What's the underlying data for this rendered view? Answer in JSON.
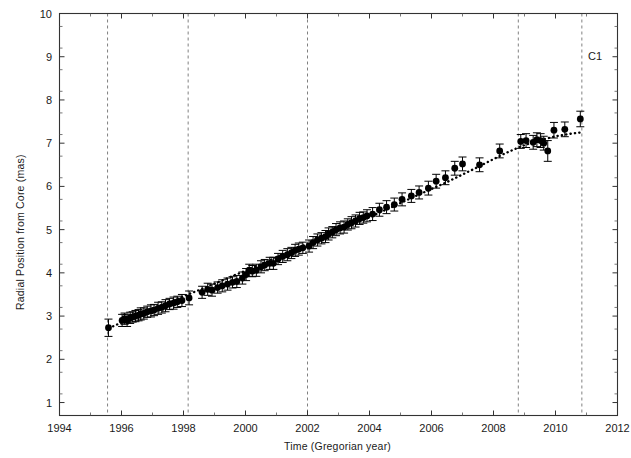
{
  "chart_data": {
    "type": "scatter",
    "title": "",
    "xlabel": "Time (Gregorian year)",
    "ylabel": "Radial Position from Core (mas)",
    "xlim": [
      1994,
      2012
    ],
    "ylim": [
      0.7,
      10
    ],
    "xticks": [
      1994,
      1996,
      1998,
      2000,
      2002,
      2004,
      2006,
      2008,
      2010,
      2012
    ],
    "yticks": [
      1,
      2,
      3,
      4,
      5,
      6,
      7,
      8,
      9,
      10
    ],
    "xtick_labels": [
      "1994",
      "1996",
      "1998",
      "2000",
      "2002",
      "2004",
      "2006",
      "2008",
      "2010",
      "2012"
    ],
    "ytick_labels": [
      "1",
      "2",
      "3",
      "4",
      "5",
      "6",
      "7",
      "8",
      "9",
      "10"
    ],
    "grid": false,
    "legend": null,
    "marker": "filled-circle",
    "marker_color": "#000000",
    "errorbar_color": "#000000",
    "annotations": [
      {
        "name": "C1",
        "text": "C1",
        "x": 2011.05,
        "y": 9.0
      }
    ],
    "vlines": [
      {
        "x": 1995.55,
        "style": "dashed",
        "color": "#808080"
      },
      {
        "x": 1998.15,
        "style": "dashed",
        "color": "#808080"
      },
      {
        "x": 2002.0,
        "style": "dashed",
        "color": "#808080"
      },
      {
        "x": 2008.8,
        "style": "dashed",
        "color": "#808080"
      },
      {
        "x": 2010.85,
        "style": "dashed",
        "color": "#808080"
      }
    ],
    "fit_curve": {
      "name": "fit",
      "style": "dotted",
      "color": "#000000",
      "x": [
        1995.6,
        1996.5,
        1997.5,
        1998.5,
        1999.5,
        2000.5,
        2001.5,
        2002.5,
        2003.5,
        2004.5,
        2005.5,
        2006.5,
        2007.5,
        2008.3,
        2008.9,
        2009.4,
        2010.0,
        2010.5,
        2010.85
      ],
      "y": [
        2.72,
        3.02,
        3.32,
        3.6,
        3.9,
        4.2,
        4.52,
        4.82,
        5.13,
        5.45,
        5.78,
        6.1,
        6.45,
        6.74,
        6.93,
        7.05,
        7.16,
        7.22,
        7.25
      ]
    },
    "series": [
      {
        "name": "C1 radial position",
        "points": [
          {
            "x": 1995.58,
            "y": 2.73,
            "yerr": 0.2
          },
          {
            "x": 1996.02,
            "y": 2.9,
            "yerr": 0.14
          },
          {
            "x": 1996.1,
            "y": 2.94,
            "yerr": 0.13
          },
          {
            "x": 1996.18,
            "y": 2.9,
            "yerr": 0.14
          },
          {
            "x": 1996.28,
            "y": 2.96,
            "yerr": 0.13
          },
          {
            "x": 1996.36,
            "y": 2.98,
            "yerr": 0.12
          },
          {
            "x": 1996.45,
            "y": 3.0,
            "yerr": 0.13
          },
          {
            "x": 1996.55,
            "y": 3.02,
            "yerr": 0.13
          },
          {
            "x": 1996.62,
            "y": 3.05,
            "yerr": 0.14
          },
          {
            "x": 1996.72,
            "y": 3.06,
            "yerr": 0.13
          },
          {
            "x": 1996.83,
            "y": 3.1,
            "yerr": 0.13
          },
          {
            "x": 1996.95,
            "y": 3.12,
            "yerr": 0.14
          },
          {
            "x": 1997.05,
            "y": 3.14,
            "yerr": 0.13
          },
          {
            "x": 1997.18,
            "y": 3.18,
            "yerr": 0.14
          },
          {
            "x": 1997.3,
            "y": 3.2,
            "yerr": 0.13
          },
          {
            "x": 1997.42,
            "y": 3.24,
            "yerr": 0.14
          },
          {
            "x": 1997.55,
            "y": 3.28,
            "yerr": 0.13
          },
          {
            "x": 1997.68,
            "y": 3.3,
            "yerr": 0.14
          },
          {
            "x": 1997.8,
            "y": 3.33,
            "yerr": 0.13
          },
          {
            "x": 1997.95,
            "y": 3.36,
            "yerr": 0.14
          },
          {
            "x": 1998.18,
            "y": 3.42,
            "yerr": 0.16
          },
          {
            "x": 1998.6,
            "y": 3.55,
            "yerr": 0.14
          },
          {
            "x": 1998.78,
            "y": 3.62,
            "yerr": 0.14
          },
          {
            "x": 1998.92,
            "y": 3.6,
            "yerr": 0.14
          },
          {
            "x": 1999.1,
            "y": 3.66,
            "yerr": 0.13
          },
          {
            "x": 1999.25,
            "y": 3.7,
            "yerr": 0.14
          },
          {
            "x": 1999.42,
            "y": 3.74,
            "yerr": 0.14
          },
          {
            "x": 1999.58,
            "y": 3.78,
            "yerr": 0.13
          },
          {
            "x": 1999.72,
            "y": 3.8,
            "yerr": 0.14
          },
          {
            "x": 1999.9,
            "y": 3.88,
            "yerr": 0.14
          },
          {
            "x": 2000.02,
            "y": 3.96,
            "yerr": 0.14
          },
          {
            "x": 2000.12,
            "y": 4.06,
            "yerr": 0.14
          },
          {
            "x": 2000.22,
            "y": 4.04,
            "yerr": 0.13
          },
          {
            "x": 2000.35,
            "y": 4.06,
            "yerr": 0.14
          },
          {
            "x": 2000.5,
            "y": 4.14,
            "yerr": 0.14
          },
          {
            "x": 2000.62,
            "y": 4.18,
            "yerr": 0.13
          },
          {
            "x": 2000.78,
            "y": 4.22,
            "yerr": 0.14
          },
          {
            "x": 2000.9,
            "y": 4.22,
            "yerr": 0.14
          },
          {
            "x": 2001.05,
            "y": 4.32,
            "yerr": 0.13
          },
          {
            "x": 2001.2,
            "y": 4.38,
            "yerr": 0.14
          },
          {
            "x": 2001.35,
            "y": 4.42,
            "yerr": 0.14
          },
          {
            "x": 2001.48,
            "y": 4.46,
            "yerr": 0.13
          },
          {
            "x": 2001.6,
            "y": 4.52,
            "yerr": 0.14
          },
          {
            "x": 2001.72,
            "y": 4.55,
            "yerr": 0.14
          },
          {
            "x": 2001.85,
            "y": 4.58,
            "yerr": 0.13
          },
          {
            "x": 2002.05,
            "y": 4.62,
            "yerr": 0.14
          },
          {
            "x": 2002.18,
            "y": 4.7,
            "yerr": 0.14
          },
          {
            "x": 2002.32,
            "y": 4.76,
            "yerr": 0.14
          },
          {
            "x": 2002.45,
            "y": 4.8,
            "yerr": 0.13
          },
          {
            "x": 2002.58,
            "y": 4.84,
            "yerr": 0.14
          },
          {
            "x": 2002.68,
            "y": 4.9,
            "yerr": 0.14
          },
          {
            "x": 2002.8,
            "y": 4.94,
            "yerr": 0.13
          },
          {
            "x": 2002.92,
            "y": 5.0,
            "yerr": 0.14
          },
          {
            "x": 2003.05,
            "y": 5.04,
            "yerr": 0.14
          },
          {
            "x": 2003.18,
            "y": 5.06,
            "yerr": 0.14
          },
          {
            "x": 2003.3,
            "y": 5.12,
            "yerr": 0.13
          },
          {
            "x": 2003.42,
            "y": 5.16,
            "yerr": 0.14
          },
          {
            "x": 2003.55,
            "y": 5.2,
            "yerr": 0.14
          },
          {
            "x": 2003.68,
            "y": 5.26,
            "yerr": 0.14
          },
          {
            "x": 2003.8,
            "y": 5.28,
            "yerr": 0.13
          },
          {
            "x": 2003.92,
            "y": 5.32,
            "yerr": 0.14
          },
          {
            "x": 2004.1,
            "y": 5.36,
            "yerr": 0.15
          },
          {
            "x": 2004.32,
            "y": 5.46,
            "yerr": 0.15
          },
          {
            "x": 2004.55,
            "y": 5.52,
            "yerr": 0.15
          },
          {
            "x": 2004.8,
            "y": 5.58,
            "yerr": 0.15
          },
          {
            "x": 2005.05,
            "y": 5.7,
            "yerr": 0.15
          },
          {
            "x": 2005.35,
            "y": 5.78,
            "yerr": 0.15
          },
          {
            "x": 2005.6,
            "y": 5.86,
            "yerr": 0.15
          },
          {
            "x": 2005.9,
            "y": 5.96,
            "yerr": 0.16
          },
          {
            "x": 2006.15,
            "y": 6.12,
            "yerr": 0.16
          },
          {
            "x": 2006.45,
            "y": 6.2,
            "yerr": 0.16
          },
          {
            "x": 2006.75,
            "y": 6.42,
            "yerr": 0.16
          },
          {
            "x": 2007.0,
            "y": 6.52,
            "yerr": 0.16
          },
          {
            "x": 2007.55,
            "y": 6.5,
            "yerr": 0.16
          },
          {
            "x": 2008.2,
            "y": 6.82,
            "yerr": 0.16
          },
          {
            "x": 2008.88,
            "y": 7.04,
            "yerr": 0.16
          },
          {
            "x": 2009.05,
            "y": 7.06,
            "yerr": 0.16
          },
          {
            "x": 2009.28,
            "y": 7.02,
            "yerr": 0.16
          },
          {
            "x": 2009.4,
            "y": 7.08,
            "yerr": 0.16
          },
          {
            "x": 2009.52,
            "y": 7.06,
            "yerr": 0.16
          },
          {
            "x": 2009.62,
            "y": 7.0,
            "yerr": 0.16
          },
          {
            "x": 2009.75,
            "y": 6.82,
            "yerr": 0.24
          },
          {
            "x": 2009.95,
            "y": 7.3,
            "yerr": 0.18
          },
          {
            "x": 2010.3,
            "y": 7.32,
            "yerr": 0.17
          },
          {
            "x": 2010.8,
            "y": 7.56,
            "yerr": 0.18
          }
        ]
      }
    ]
  }
}
